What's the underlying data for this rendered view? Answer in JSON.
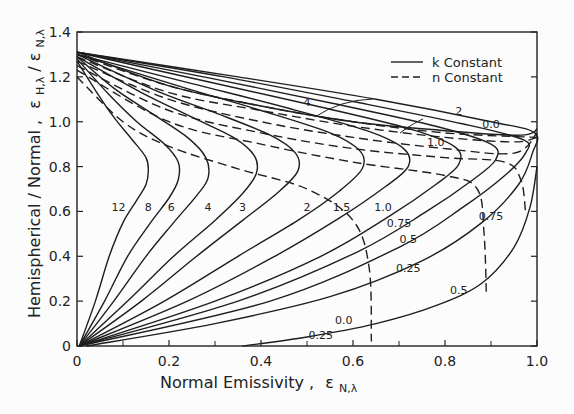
{
  "chart_data": {
    "type": "line",
    "title": "",
    "xlabel": "Normal Emissivity, ε_N,λ",
    "ylabel": "Hemispherical / Normal, ε_H,λ / ε_N,λ",
    "xlabel_main": "Normal  Emissivity ,",
    "xlabel_symbol": "ε",
    "xlabel_sub": "N,λ",
    "ylabel_main": "Hemispherical / Normal ,",
    "ylabel_symbol1": "ε",
    "ylabel_sub1": "H,λ",
    "ylabel_slash": "/",
    "ylabel_symbol2": "ε",
    "ylabel_sub2": "N,λ",
    "xlim": [
      0,
      1.0
    ],
    "ylim": [
      0,
      1.4
    ],
    "x_ticks": [
      0,
      0.2,
      0.4,
      0.6,
      0.8,
      1.0
    ],
    "x_tick_labels": [
      "0",
      "0.2",
      "0.4",
      "0.6",
      "0.8",
      "1.0"
    ],
    "x_minor_ticks": [
      0.1,
      0.3,
      0.5,
      0.7,
      0.9
    ],
    "y_ticks": [
      0,
      0.2,
      0.4,
      0.6,
      0.8,
      1.0,
      1.2,
      1.4
    ],
    "y_tick_labels": [
      "0",
      "0.2",
      "0.4",
      "0.6",
      "0.8",
      "1.0",
      "1.2",
      "1.4"
    ],
    "grid": false,
    "legend": {
      "position": "upper right",
      "entries": [
        {
          "label": "k Constant",
          "style": "solid"
        },
        {
          "label": "n Constant",
          "style": "dashed"
        }
      ]
    },
    "series": [
      {
        "name": "k = 12",
        "style": "solid",
        "label": "12",
        "label_at": [
          0.09,
          0.6
        ],
        "points": [
          [
            0.005,
            0.0
          ],
          [
            0.04,
            0.2
          ],
          [
            0.07,
            0.4
          ],
          [
            0.1,
            0.55
          ],
          [
            0.13,
            0.65
          ],
          [
            0.15,
            0.72
          ],
          [
            0.155,
            0.78
          ],
          [
            0.15,
            0.84
          ],
          [
            0.12,
            0.92
          ],
          [
            0.08,
            1.02
          ],
          [
            0.04,
            1.14
          ],
          [
            0.0,
            1.27
          ]
        ]
      },
      {
        "name": "k = 8",
        "style": "solid",
        "label": "8",
        "label_at": [
          0.155,
          0.6
        ],
        "points": [
          [
            0.005,
            0.0
          ],
          [
            0.06,
            0.2
          ],
          [
            0.11,
            0.4
          ],
          [
            0.16,
            0.55
          ],
          [
            0.2,
            0.66
          ],
          [
            0.22,
            0.74
          ],
          [
            0.22,
            0.82
          ],
          [
            0.19,
            0.9
          ],
          [
            0.13,
            1.0
          ],
          [
            0.07,
            1.12
          ],
          [
            0.0,
            1.28
          ]
        ]
      },
      {
        "name": "k = 6",
        "style": "solid",
        "label": "6",
        "label_at": [
          0.205,
          0.6
        ],
        "points": [
          [
            0.005,
            0.0
          ],
          [
            0.08,
            0.2
          ],
          [
            0.15,
            0.4
          ],
          [
            0.21,
            0.55
          ],
          [
            0.26,
            0.67
          ],
          [
            0.285,
            0.75
          ],
          [
            0.28,
            0.84
          ],
          [
            0.24,
            0.93
          ],
          [
            0.16,
            1.04
          ],
          [
            0.08,
            1.15
          ],
          [
            0.0,
            1.29
          ]
        ]
      },
      {
        "name": "k = 4",
        "style": "solid",
        "label": "4",
        "label_at": [
          0.285,
          0.6
        ],
        "points": [
          [
            0.005,
            0.0
          ],
          [
            0.11,
            0.2
          ],
          [
            0.21,
            0.4
          ],
          [
            0.3,
            0.56
          ],
          [
            0.36,
            0.68
          ],
          [
            0.39,
            0.77
          ],
          [
            0.385,
            0.85
          ],
          [
            0.34,
            0.93
          ],
          [
            0.25,
            1.02
          ],
          [
            0.14,
            1.13
          ],
          [
            0.0,
            1.29
          ]
        ]
      },
      {
        "name": "k = 3",
        "style": "solid",
        "label": "3",
        "label_at": [
          0.36,
          0.6
        ],
        "points": [
          [
            0.005,
            0.0
          ],
          [
            0.14,
            0.2
          ],
          [
            0.26,
            0.4
          ],
          [
            0.36,
            0.56
          ],
          [
            0.44,
            0.69
          ],
          [
            0.48,
            0.78
          ],
          [
            0.475,
            0.86
          ],
          [
            0.42,
            0.94
          ],
          [
            0.3,
            1.04
          ],
          [
            0.17,
            1.14
          ],
          [
            0.0,
            1.3
          ]
        ]
      },
      {
        "name": "k = 2",
        "style": "solid",
        "label": "2",
        "label_at": [
          0.5,
          0.6
        ],
        "points": [
          [
            0.005,
            0.0
          ],
          [
            0.19,
            0.2
          ],
          [
            0.35,
            0.4
          ],
          [
            0.48,
            0.56
          ],
          [
            0.57,
            0.69
          ],
          [
            0.62,
            0.79
          ],
          [
            0.615,
            0.87
          ],
          [
            0.55,
            0.95
          ],
          [
            0.4,
            1.05
          ],
          [
            0.22,
            1.16
          ],
          [
            0.0,
            1.3
          ]
        ]
      },
      {
        "name": "k = 1.5",
        "style": "solid",
        "label": "1.5",
        "label_at": [
          0.575,
          0.6
        ],
        "points": [
          [
            0.005,
            0.0
          ],
          [
            0.24,
            0.2
          ],
          [
            0.43,
            0.4
          ],
          [
            0.57,
            0.57
          ],
          [
            0.67,
            0.71
          ],
          [
            0.72,
            0.8
          ],
          [
            0.71,
            0.88
          ],
          [
            0.63,
            0.96
          ],
          [
            0.46,
            1.06
          ],
          [
            0.25,
            1.17
          ],
          [
            0.0,
            1.3
          ]
        ]
      },
      {
        "name": "k = 1.0",
        "style": "solid",
        "label": "1.0",
        "label_at": [
          0.665,
          0.6
        ],
        "points": [
          [
            0.005,
            0.0
          ],
          [
            0.3,
            0.2
          ],
          [
            0.53,
            0.4
          ],
          [
            0.68,
            0.58
          ],
          [
            0.78,
            0.72
          ],
          [
            0.83,
            0.81
          ],
          [
            0.82,
            0.89
          ],
          [
            0.72,
            0.97
          ],
          [
            0.52,
            1.07
          ],
          [
            0.28,
            1.18
          ],
          [
            0.0,
            1.31
          ]
        ]
      },
      {
        "name": "k = 0.75",
        "style": "solid",
        "label": "0.75",
        "label_at": [
          0.7,
          0.53
        ],
        "points": [
          [
            0.005,
            0.0
          ],
          [
            0.35,
            0.2
          ],
          [
            0.61,
            0.42
          ],
          [
            0.76,
            0.6
          ],
          [
            0.86,
            0.74
          ],
          [
            0.91,
            0.83
          ],
          [
            0.9,
            0.9
          ],
          [
            0.78,
            0.98
          ],
          [
            0.56,
            1.08
          ],
          [
            0.3,
            1.19
          ],
          [
            0.0,
            1.31
          ]
        ]
      },
      {
        "name": "k = 0.5",
        "style": "solid",
        "label": "0.5",
        "label_at": [
          0.72,
          0.46
        ],
        "points": [
          [
            0.005,
            0.0
          ],
          [
            0.42,
            0.2
          ],
          [
            0.7,
            0.44
          ],
          [
            0.84,
            0.62
          ],
          [
            0.93,
            0.76
          ],
          [
            0.975,
            0.86
          ],
          [
            0.97,
            0.92
          ],
          [
            0.84,
            0.99
          ],
          [
            0.6,
            1.09
          ],
          [
            0.32,
            1.2
          ],
          [
            0.0,
            1.31
          ]
        ]
      },
      {
        "name": "k = 0.25",
        "style": "solid",
        "label": "0.25",
        "label_at": [
          0.72,
          0.33
        ],
        "points": [
          [
            0.02,
            0.0
          ],
          [
            0.3,
            0.1
          ],
          [
            0.55,
            0.22
          ],
          [
            0.75,
            0.38
          ],
          [
            0.88,
            0.55
          ],
          [
            0.96,
            0.72
          ],
          [
            0.99,
            0.86
          ],
          [
            0.995,
            0.95
          ],
          [
            0.9,
            1.0
          ],
          [
            0.65,
            1.1
          ],
          [
            0.35,
            1.2
          ],
          [
            0.0,
            1.31
          ]
        ]
      },
      {
        "name": "k = 0.0",
        "style": "solid",
        "label": "0.0",
        "label_at": [
          0.58,
          0.1
        ],
        "points": [
          [
            0.36,
            0.0
          ],
          [
            0.5,
            0.04
          ],
          [
            0.65,
            0.1
          ],
          [
            0.78,
            0.18
          ],
          [
            0.88,
            0.28
          ],
          [
            0.95,
            0.44
          ],
          [
            0.985,
            0.62
          ],
          [
            1.0,
            0.8
          ]
        ]
      },
      {
        "name": "k = 0.0 (upper)",
        "style": "solid",
        "label": "0.0",
        "label_at": [
          0.9,
          0.97
        ],
        "points": [
          [
            0.0,
            1.31
          ],
          [
            0.2,
            1.16
          ],
          [
            0.4,
            1.07
          ],
          [
            0.6,
            1.0
          ],
          [
            0.8,
            0.96
          ],
          [
            0.95,
            0.94
          ],
          [
            0.99,
            0.95
          ],
          [
            1.0,
            0.97
          ]
        ]
      },
      {
        "name": "n = 4",
        "style": "dashed",
        "label": "4",
        "label_at": [
          0.5,
          1.07
        ],
        "points": [
          [
            0.0,
            1.3
          ],
          [
            0.2,
            1.16
          ],
          [
            0.4,
            1.07
          ],
          [
            0.6,
            1.0
          ],
          [
            0.8,
            0.95
          ],
          [
            1.0,
            0.93
          ]
        ]
      },
      {
        "name": "n = 2",
        "style": "dashed",
        "label": "2",
        "label_at": [
          0.83,
          1.03
        ],
        "points": [
          [
            0.0,
            1.29
          ],
          [
            0.2,
            1.13
          ],
          [
            0.4,
            1.05
          ],
          [
            0.6,
            0.98
          ],
          [
            0.8,
            0.93
          ],
          [
            0.95,
            0.91
          ],
          [
            1.0,
            0.93
          ]
        ]
      },
      {
        "name": "n = 1.0",
        "style": "dashed",
        "label": "1.0",
        "label_at": [
          0.78,
          0.89
        ],
        "points": [
          [
            0.0,
            1.27
          ],
          [
            0.2,
            1.1
          ],
          [
            0.4,
            1.0
          ],
          [
            0.6,
            0.93
          ],
          [
            0.8,
            0.88
          ],
          [
            0.95,
            0.86
          ],
          [
            1.0,
            0.95
          ]
        ]
      },
      {
        "name": "n = 0.75",
        "style": "dashed",
        "label": "0.75",
        "label_at": [
          0.9,
          0.56
        ],
        "points": [
          [
            0.0,
            1.25
          ],
          [
            0.2,
            1.05
          ],
          [
            0.4,
            0.95
          ],
          [
            0.6,
            0.88
          ],
          [
            0.8,
            0.84
          ],
          [
            0.93,
            0.82
          ],
          [
            0.965,
            0.74
          ],
          [
            0.975,
            0.6
          ]
        ]
      },
      {
        "name": "n = 0.5",
        "style": "dashed",
        "label": "0.5",
        "label_at": [
          0.83,
          0.23
        ],
        "points": [
          [
            0.0,
            1.23
          ],
          [
            0.2,
            1.0
          ],
          [
            0.4,
            0.9
          ],
          [
            0.6,
            0.82
          ],
          [
            0.8,
            0.76
          ],
          [
            0.87,
            0.7
          ],
          [
            0.885,
            0.5
          ],
          [
            0.89,
            0.22
          ]
        ]
      },
      {
        "name": "n = 0.25",
        "style": "dashed",
        "label": "0.25",
        "label_at": [
          0.53,
          0.03
        ],
        "points": [
          [
            0.0,
            1.2
          ],
          [
            0.1,
            1.0
          ],
          [
            0.2,
            0.89
          ],
          [
            0.35,
            0.79
          ],
          [
            0.5,
            0.7
          ],
          [
            0.6,
            0.56
          ],
          [
            0.635,
            0.35
          ],
          [
            0.64,
            0.02
          ]
        ]
      }
    ]
  },
  "plot_box": {
    "left": 77,
    "top": 32,
    "right": 537,
    "bottom": 346
  }
}
